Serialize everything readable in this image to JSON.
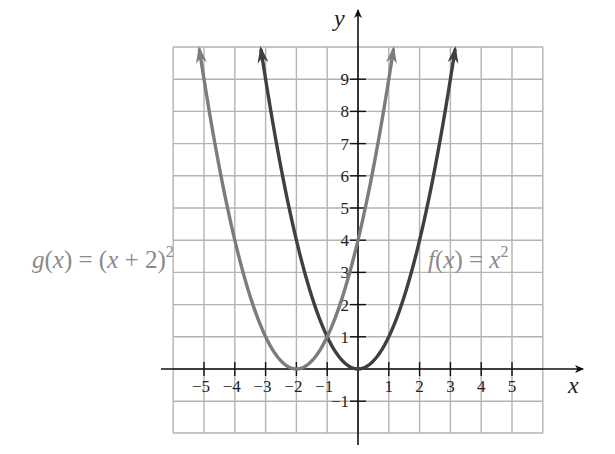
{
  "chart_data": {
    "type": "line",
    "title": "",
    "xlabel": "x",
    "ylabel": "y",
    "xlim": [
      -6,
      6
    ],
    "ylim": [
      -2,
      10
    ],
    "grid": true,
    "x_ticks": [
      -5,
      -4,
      -3,
      -2,
      -1,
      1,
      2,
      3,
      4,
      5
    ],
    "x_tick_labels": [
      "−5",
      "−4",
      "−3",
      "−2",
      "−1",
      "1",
      "2",
      "3",
      "4",
      "5"
    ],
    "y_ticks": [
      -1,
      1,
      2,
      3,
      4,
      5,
      6,
      7,
      8,
      9
    ],
    "y_tick_labels": [
      "−1",
      "1",
      "2",
      "3",
      "4",
      "5",
      "6",
      "7",
      "8",
      "9"
    ],
    "series": [
      {
        "name": "f(x) = x^2",
        "label": "f(x) = x²",
        "formula": "x^2",
        "color": "#3f3f3f",
        "x": [
          -3,
          -2,
          -1,
          0,
          1,
          2,
          3
        ],
        "y": [
          9,
          4,
          1,
          0,
          1,
          4,
          9
        ],
        "vertex": [
          0,
          0
        ],
        "arrows": "both ends"
      },
      {
        "name": "g(x) = (x + 2)^2",
        "label": "g(x) = (x + 2)²",
        "formula": "(x+2)^2",
        "color": "#7c7c7c",
        "x": [
          -5,
          -4,
          -3,
          -2,
          -1,
          0,
          1
        ],
        "y": [
          9,
          4,
          1,
          0,
          1,
          4,
          9
        ],
        "vertex": [
          -2,
          0
        ],
        "arrows": "both ends"
      }
    ],
    "annotations": [
      {
        "text": "g(x) = (x + 2)²",
        "position": "left of grid, y≈4"
      },
      {
        "text": "f(x) = x²",
        "position": "right side, y≈4"
      }
    ]
  },
  "labels": {
    "x_axis": "x",
    "y_axis": "y",
    "f": {
      "prefix": "f(x) = x",
      "sup": "2"
    },
    "g": {
      "prefix": "g(x) = (x + 2)",
      "sup": "2"
    }
  },
  "colors": {
    "f_curve": "#3f3f3f",
    "g_curve": "#7c7c7c",
    "grid": "#b3b3b3",
    "axis": "#111111",
    "f_label": "#8a8a8a",
    "g_label": "#8a8a8a"
  }
}
